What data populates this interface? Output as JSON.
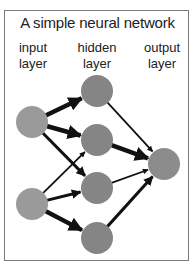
{
  "title": "A simple neural network",
  "layers": [
    {
      "name": "input",
      "label_line1": "input",
      "label_line2": "layer"
    },
    {
      "name": "hidden",
      "label_line1": "hidden",
      "label_line2": "layer"
    },
    {
      "name": "output",
      "label_line1": "output",
      "label_line2": "layer"
    }
  ],
  "colors": {
    "input_node": "#9a9a9a",
    "hidden_node": "#858585",
    "output_node": "#8c8c8c",
    "edge": "#111111",
    "frame": "#7a7a7a"
  },
  "nodes": {
    "input": [
      {
        "cx": 32,
        "cy": 122
      },
      {
        "cx": 32,
        "cy": 204
      }
    ],
    "hidden": [
      {
        "cx": 97,
        "cy": 91
      },
      {
        "cx": 97,
        "cy": 140
      },
      {
        "cx": 97,
        "cy": 188
      },
      {
        "cx": 97,
        "cy": 238
      }
    ],
    "output": [
      {
        "cx": 164,
        "cy": 164
      }
    ]
  },
  "edges": [
    {
      "from": "input-1",
      "to": "hidden-1",
      "weight": "thick"
    },
    {
      "from": "input-1",
      "to": "hidden-2",
      "weight": "thick"
    },
    {
      "from": "input-1",
      "to": "hidden-3",
      "weight": "medium"
    },
    {
      "from": "input-2",
      "to": "hidden-2",
      "weight": "thin"
    },
    {
      "from": "input-2",
      "to": "hidden-3",
      "weight": "medium"
    },
    {
      "from": "input-2",
      "to": "hidden-4",
      "weight": "thick"
    },
    {
      "from": "hidden-1",
      "to": "output-1",
      "weight": "thin"
    },
    {
      "from": "hidden-2",
      "to": "output-1",
      "weight": "thick"
    },
    {
      "from": "hidden-3",
      "to": "output-1",
      "weight": "thin"
    },
    {
      "from": "hidden-4",
      "to": "output-1",
      "weight": "medium"
    }
  ]
}
